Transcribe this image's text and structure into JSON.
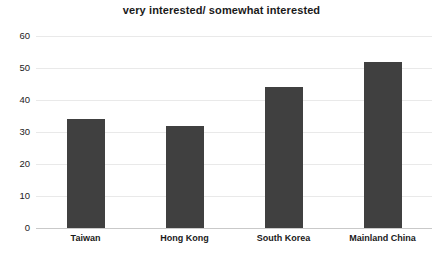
{
  "chart_data": {
    "type": "bar",
    "title": "very interested/ somewhat interested",
    "xlabel": "",
    "ylabel": "",
    "categories": [
      "Taiwan",
      "Hong Kong",
      "South Korea",
      "Mainland China"
    ],
    "values": [
      34,
      32,
      44,
      52
    ],
    "ylim": [
      0,
      60
    ],
    "ytick_labels": [
      "0",
      "10",
      "20",
      "30",
      "40",
      "50",
      "60"
    ],
    "ytick_values": [
      0,
      10,
      20,
      30,
      40,
      50,
      60
    ],
    "grid": true,
    "legend": false,
    "series": [
      {
        "name": "very interested/ somewhat interested",
        "values": [
          34,
          32,
          44,
          52
        ]
      }
    ],
    "colors": {
      "bar": "#404040",
      "gridline": "#e9e9e9",
      "baseline": "#c9c9c9",
      "text": "#1a1a1a",
      "background": "#ffffff"
    }
  }
}
